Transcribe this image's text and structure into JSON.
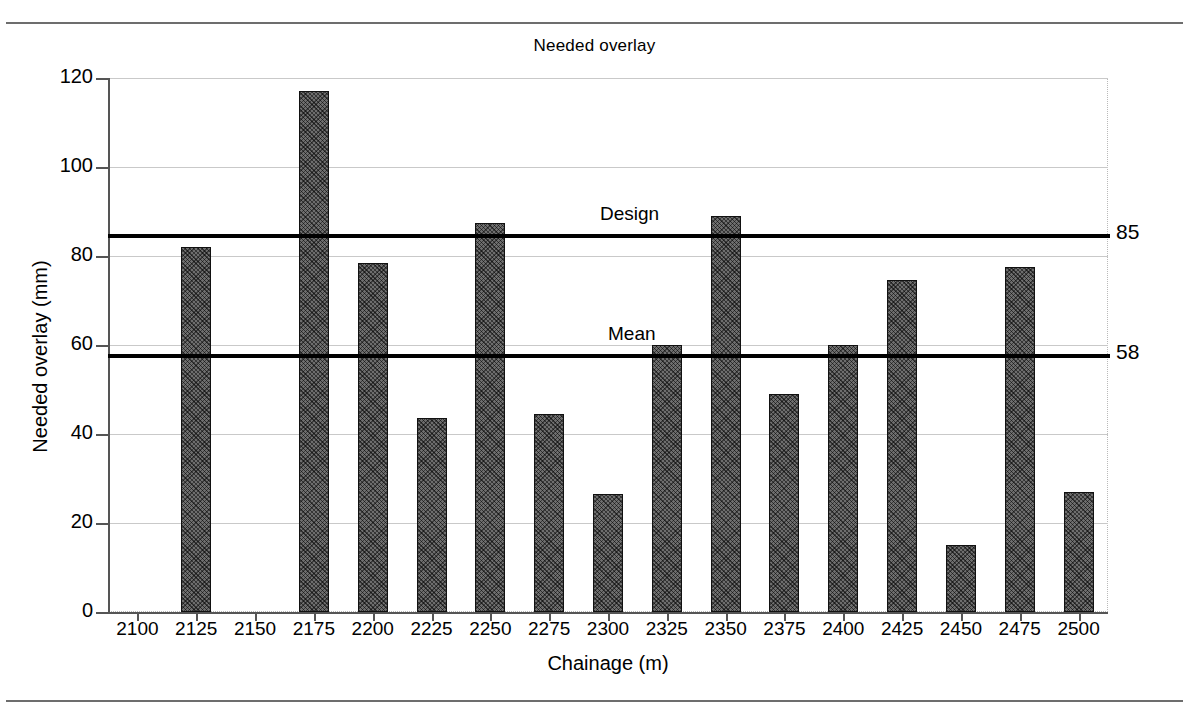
{
  "chart_data": {
    "type": "bar",
    "title": "Needed overlay",
    "xlabel": "Chainage (m)",
    "ylabel": "Needed overlay (mm)",
    "ylim": [
      0,
      120
    ],
    "ytick_labels": [
      "0",
      "20",
      "40",
      "60",
      "80",
      "100",
      "120"
    ],
    "yticks": [
      0,
      20,
      40,
      60,
      80,
      100,
      120
    ],
    "grid": true,
    "legend_position": "none",
    "categories": [
      "2100",
      "2125",
      "2150",
      "2175",
      "2200",
      "2225",
      "2250",
      "2275",
      "2300",
      "2325",
      "2350",
      "2375",
      "2400",
      "2425",
      "2450",
      "2475",
      "2500"
    ],
    "values": [
      0,
      82,
      0,
      117,
      78.5,
      43.5,
      87.5,
      44.5,
      26.5,
      60,
      89,
      49,
      60,
      74.5,
      15,
      77.5,
      27
    ],
    "annotations": [
      {
        "name": "design-line",
        "label": "Design",
        "value": 85,
        "value_label": "85"
      },
      {
        "name": "mean-line",
        "label": "Mean",
        "value": 58,
        "value_label": "58"
      }
    ],
    "colors": {
      "bar_fill": "#6e6e6e",
      "bar_edge": "#111111",
      "refline": "#000000",
      "gridline": "#c9c9c9",
      "axis": "#555555",
      "background": "#ffffff"
    }
  }
}
